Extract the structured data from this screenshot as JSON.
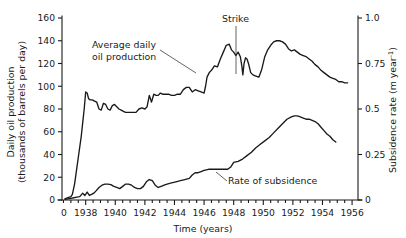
{
  "chart_data": {
    "type": "line",
    "title": "",
    "subtitle": "",
    "xlabel": "Time (years)",
    "ylabel": "Daily oil production (thousands of barrels per day)",
    "ylabel_line1": "Daily oil production",
    "ylabel_line2": "(thousands of barrels per day)",
    "y2label": "Subsidence rate (m year",
    "y2label_sup": "-1",
    "y2label_tail": ")",
    "grid": false,
    "legend_position": "inline-annotations",
    "xlim": [
      1936.4,
      1956.4
    ],
    "ylim": [
      0,
      160
    ],
    "y2lim": [
      0,
      1.0
    ],
    "xticks": [
      1938,
      1940,
      1942,
      1944,
      1946,
      1948,
      1950,
      1952,
      1954,
      1956
    ],
    "xtick_labels": [
      "1938",
      "1940",
      "1942",
      "1944",
      "1946",
      "1948",
      "1950",
      "1952",
      "1954",
      "1956"
    ],
    "x_origin_label": "0",
    "xminor_interval": 0.5,
    "yticks": [
      0,
      20,
      40,
      60,
      80,
      100,
      120,
      140,
      160
    ],
    "ytick_labels": [
      "0",
      "20",
      "40",
      "60",
      "80",
      "100",
      "120",
      "140",
      "160"
    ],
    "y2ticks": [
      0,
      0.25,
      0.5,
      0.75,
      1.0
    ],
    "y2tick_labels": [
      "0",
      "0.25",
      "0.5",
      "0.75",
      "1.0"
    ],
    "annotations": [
      {
        "name": "average-daily-oil-production",
        "text_line1": "Average daily",
        "text_line2": "oil production",
        "text_x": 92,
        "text_y": 48,
        "leader": "M 160,50 L 196,73"
      },
      {
        "name": "strike",
        "text_line1": "Strike",
        "text_x": 222,
        "text_y": 22,
        "leader": "M 236,26 L 236,74"
      },
      {
        "name": "rate-of-subsidence",
        "text_line1": "Rate of subsidence",
        "text_x": 228,
        "text_y": 184,
        "leader": "M 227,181 L 216,172"
      }
    ],
    "series": [
      {
        "name": "Average daily oil production",
        "axis": "left",
        "units": "thousands of barrels per day",
        "x": [
          1936.6,
          1936.8,
          1937.0,
          1937.1,
          1937.25,
          1937.4,
          1937.55,
          1937.7,
          1937.8,
          1937.9,
          1938.0,
          1938.1,
          1938.2,
          1938.3,
          1938.45,
          1938.6,
          1938.75,
          1938.9,
          1939.05,
          1939.2,
          1939.35,
          1939.5,
          1939.65,
          1939.8,
          1939.95,
          1940.1,
          1940.25,
          1940.4,
          1940.55,
          1940.7,
          1940.85,
          1941.0,
          1941.2,
          1941.4,
          1941.6,
          1941.8,
          1942.0,
          1942.15,
          1942.3,
          1942.45,
          1942.6,
          1942.75,
          1942.9,
          1943.05,
          1943.2,
          1943.4,
          1943.6,
          1943.8,
          1944.0,
          1944.2,
          1944.4,
          1944.6,
          1944.8,
          1945.0,
          1945.2,
          1945.4,
          1945.6,
          1945.8,
          1946.0,
          1946.1,
          1946.2,
          1946.35,
          1946.5,
          1946.7,
          1946.9,
          1947.1,
          1947.3,
          1947.5,
          1947.7,
          1947.85,
          1948.0,
          1948.15,
          1948.3,
          1948.45,
          1948.55,
          1948.62,
          1948.7,
          1948.8,
          1948.9,
          1949.0,
          1949.15,
          1949.3,
          1949.5,
          1949.7,
          1949.9,
          1950.1,
          1950.3,
          1950.5,
          1950.7,
          1950.9,
          1951.1,
          1951.3,
          1951.5,
          1951.7,
          1951.9,
          1952.1,
          1952.3,
          1952.5,
          1952.7,
          1952.9,
          1953.1,
          1953.3,
          1953.5,
          1953.7,
          1953.9,
          1954.1,
          1954.3,
          1954.5,
          1954.7,
          1954.9,
          1955.1,
          1955.3,
          1955.5,
          1955.7
        ],
        "values": [
          1,
          2,
          3,
          5,
          14,
          28,
          42,
          56,
          68,
          80,
          95,
          94,
          89,
          88,
          88,
          87,
          86,
          80,
          79,
          85,
          84,
          80,
          79,
          83,
          84,
          82,
          80,
          79,
          78,
          77,
          77,
          77,
          77,
          77,
          80,
          81,
          80,
          82,
          92,
          86,
          93,
          92,
          92,
          94,
          93,
          93,
          93,
          92,
          92,
          93,
          93,
          97,
          99,
          99,
          95,
          97,
          96,
          95,
          94,
          100,
          108,
          112,
          114,
          118,
          117,
          124,
          130,
          136,
          137,
          132,
          130,
          127,
          130,
          126,
          118,
          110,
          120,
          125,
          124,
          120,
          112,
          110,
          109,
          108,
          115,
          126,
          132,
          136,
          139,
          140,
          140,
          139,
          137,
          133,
          131,
          132,
          130,
          128,
          127,
          126,
          124,
          122,
          119,
          117,
          114,
          112,
          110,
          108,
          107,
          106,
          104,
          104,
          103,
          103
        ]
      },
      {
        "name": "Rate of subsidence",
        "axis": "right",
        "units": "m year^-1",
        "x": [
          1936.6,
          1936.8,
          1937.0,
          1937.2,
          1937.4,
          1937.6,
          1937.8,
          1937.95,
          1938.1,
          1938.25,
          1938.4,
          1938.55,
          1938.7,
          1938.9,
          1939.1,
          1939.3,
          1939.5,
          1939.7,
          1939.9,
          1940.1,
          1940.3,
          1940.5,
          1940.7,
          1940.9,
          1941.1,
          1941.3,
          1941.5,
          1941.7,
          1941.9,
          1942.1,
          1942.3,
          1942.5,
          1942.7,
          1942.9,
          1943.1,
          1943.3,
          1943.5,
          1943.8,
          1944.1,
          1944.4,
          1944.7,
          1945.0,
          1945.2,
          1945.4,
          1945.6,
          1945.8,
          1946.0,
          1946.3,
          1946.6,
          1946.9,
          1947.2,
          1947.4,
          1947.6,
          1947.8,
          1948.0,
          1948.3,
          1948.6,
          1948.9,
          1949.2,
          1949.5,
          1949.8,
          1950.1,
          1950.4,
          1950.7,
          1951.0,
          1951.3,
          1951.6,
          1951.9,
          1952.1,
          1952.3,
          1952.5,
          1952.7,
          1952.9,
          1953.1,
          1953.3,
          1953.5,
          1953.7,
          1953.9,
          1954.1,
          1954.3,
          1954.5,
          1954.7,
          1954.9
        ],
        "values_left_scale": [
          0.5,
          1,
          1.5,
          2,
          2.5,
          3,
          6,
          4,
          7,
          4,
          5,
          6,
          8,
          11,
          13,
          14,
          14,
          13.5,
          12,
          11,
          10,
          12,
          14,
          14,
          13,
          11,
          10,
          10,
          12,
          16,
          18,
          17,
          13,
          11,
          12,
          13,
          14,
          15,
          16,
          17,
          18,
          19,
          22,
          24,
          24,
          25,
          26,
          27,
          27,
          27,
          27,
          27,
          27,
          29,
          33,
          34,
          36,
          39,
          42,
          46,
          49,
          52,
          55,
          59,
          63,
          67,
          71,
          73,
          74,
          74,
          73,
          72,
          71,
          71,
          70,
          69,
          67,
          64,
          61,
          58,
          56,
          53,
          51
        ],
        "values": [
          0.003,
          0.006,
          0.009,
          0.013,
          0.016,
          0.019,
          0.038,
          0.025,
          0.044,
          0.025,
          0.031,
          0.038,
          0.05,
          0.069,
          0.081,
          0.088,
          0.088,
          0.084,
          0.075,
          0.069,
          0.063,
          0.075,
          0.088,
          0.088,
          0.081,
          0.069,
          0.063,
          0.063,
          0.075,
          0.1,
          0.113,
          0.106,
          0.081,
          0.069,
          0.075,
          0.081,
          0.088,
          0.094,
          0.1,
          0.106,
          0.113,
          0.119,
          0.138,
          0.15,
          0.15,
          0.156,
          0.163,
          0.169,
          0.169,
          0.169,
          0.169,
          0.169,
          0.169,
          0.181,
          0.206,
          0.213,
          0.225,
          0.244,
          0.263,
          0.288,
          0.306,
          0.325,
          0.344,
          0.369,
          0.394,
          0.419,
          0.444,
          0.456,
          0.463,
          0.463,
          0.456,
          0.45,
          0.444,
          0.444,
          0.438,
          0.431,
          0.419,
          0.4,
          0.381,
          0.363,
          0.35,
          0.331,
          0.319
        ]
      }
    ]
  }
}
